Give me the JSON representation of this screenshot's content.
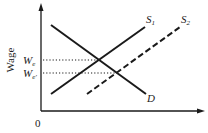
{
  "diagram": {
    "type": "labor-market supply-demand",
    "y_axis_label": "Wage",
    "origin_label": "0",
    "curves": [
      {
        "name": "D",
        "label_main": "D",
        "label_sub": "",
        "style": "solid"
      },
      {
        "name": "S1",
        "label_main": "S",
        "label_sub": "1",
        "style": "solid"
      },
      {
        "name": "S2",
        "label_main": "S",
        "label_sub": "2",
        "style": "dashed"
      }
    ],
    "wage_levels": [
      {
        "label_main": "W",
        "label_sub": "e",
        "style": "dotted"
      },
      {
        "label_main": "W",
        "label_sub": "e'",
        "style": "dotted"
      }
    ],
    "colors": {
      "line": "#1a1a1a",
      "background": "#ffffff"
    }
  }
}
